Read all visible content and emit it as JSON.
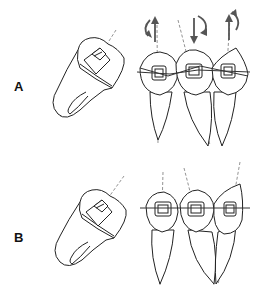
{
  "figure": {
    "panels": [
      {
        "label": "A",
        "description": "Tipped molar with bracket (side view) and three teeth with brackets on a straight archwire; rotation/extrusion/intrusion arrows above teeth",
        "movement_arrows": [
          "rotate-and-extrude",
          "intrude-and-rotate",
          "extrude-and-rotate"
        ]
      },
      {
        "label": "B",
        "description": "Tipped molar with bracket (side view) and three teeth with brackets aligned on a level horizontal archwire"
      }
    ]
  }
}
